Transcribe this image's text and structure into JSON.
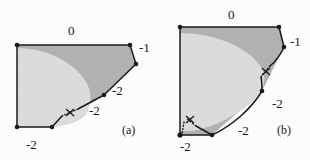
{
  "figure": {
    "width": 310,
    "height": 160,
    "background": "#fdfdfd",
    "colors": {
      "dark_fill": "#b2b2b2",
      "light_fill": "#dcdcdc",
      "outline": "#1a1a1a",
      "text": "#1a1a1a"
    }
  },
  "panels": [
    {
      "tag": "(a)",
      "tag_x": 122,
      "tag_y": 124,
      "labels": [
        {
          "text": "0",
          "x": 68,
          "y": 24
        },
        {
          "text": "-1",
          "x": 139,
          "y": 41
        },
        {
          "text": "-2",
          "x": 112,
          "y": 84
        },
        {
          "text": "-2",
          "x": 89,
          "y": 104
        },
        {
          "text": "-2",
          "x": 26,
          "y": 138
        }
      ],
      "vertices": [
        {
          "x": 17,
          "y": 45
        },
        {
          "x": 130,
          "y": 45
        },
        {
          "x": 136,
          "y": 64
        },
        {
          "x": 104,
          "y": 95
        },
        {
          "x": 52,
          "y": 127
        },
        {
          "x": 17,
          "y": 127
        }
      ],
      "cross_markers": [
        {
          "x": 70,
          "y": 111
        }
      ]
    },
    {
      "tag": "(b)",
      "tag_x": 277,
      "tag_y": 124,
      "labels": [
        {
          "text": "0",
          "x": 228,
          "y": 10
        },
        {
          "text": "-1",
          "x": 293,
          "y": 35
        },
        {
          "text": "-2",
          "x": 272,
          "y": 97
        },
        {
          "text": "-2",
          "x": 241,
          "y": 125
        },
        {
          "text": "-2",
          "x": 184,
          "y": 145
        }
      ],
      "vertices": [
        {
          "x": 180,
          "y": 27
        },
        {
          "x": 279,
          "y": 27
        },
        {
          "x": 284,
          "y": 47
        },
        {
          "x": 262,
          "y": 91
        },
        {
          "x": 212,
          "y": 135
        },
        {
          "x": 180,
          "y": 135
        }
      ],
      "cross_markers": [
        {
          "x": 265,
          "y": 71
        },
        {
          "x": 190,
          "y": 120
        }
      ]
    }
  ],
  "legend": {
    "level_zero": "0",
    "level_minus_one": "-1",
    "level_minus_two": "-2",
    "panel_a": "(a)",
    "panel_b": "(b)"
  }
}
